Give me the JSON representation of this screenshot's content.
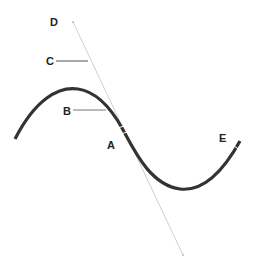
{
  "diagram": {
    "title": "",
    "labels": {
      "A": "A",
      "B": "B",
      "C": "C",
      "D": "D",
      "E": "E"
    },
    "colors": {
      "curve": "#333333",
      "tangent": "#cccccc",
      "leader": "#555555",
      "text": "#222222"
    }
  }
}
